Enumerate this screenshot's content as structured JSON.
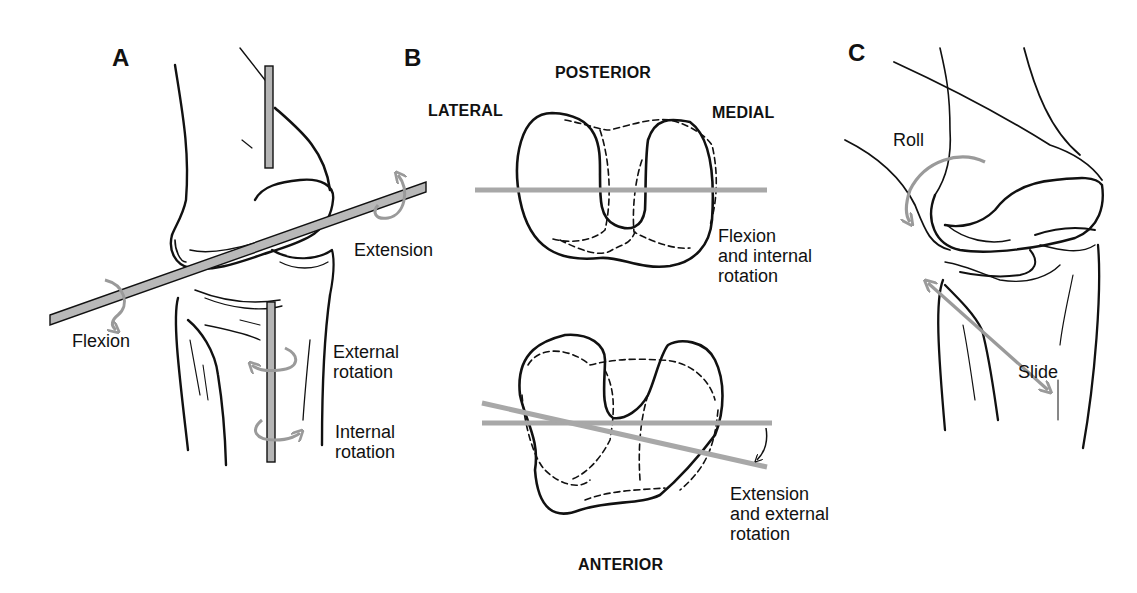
{
  "figure": {
    "panels": [
      {
        "id": "A",
        "letter": "A",
        "labels": {
          "extension": "Extension",
          "flexion": "Flexion",
          "external_rotation_1": "External",
          "external_rotation_2": "rotation",
          "internal_rotation_1": "Internal",
          "internal_rotation_2": "rotation"
        }
      },
      {
        "id": "B",
        "letter": "B",
        "labels": {
          "posterior": "POSTERIOR",
          "lateral": "LATERAL",
          "medial": "MEDIAL",
          "anterior": "ANTERIOR",
          "flexion_internal_1": "Flexion",
          "flexion_internal_2": "and internal",
          "flexion_internal_3": "rotation",
          "extension_external_1": "Extension",
          "extension_external_2": "and external",
          "extension_external_3": "rotation"
        }
      },
      {
        "id": "C",
        "letter": "C",
        "labels": {
          "roll": "Roll",
          "slide": "Slide"
        }
      }
    ],
    "colors": {
      "line": "#111111",
      "axis_rod": "#a8a8a8",
      "arrow": "#9a9a9a",
      "background": "#ffffff"
    }
  }
}
